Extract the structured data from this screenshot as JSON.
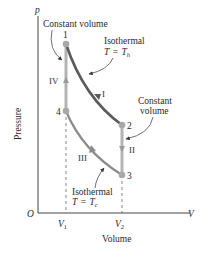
{
  "diagram": {
    "type": "pV diagram - Stirling cycle",
    "axes": {
      "y_axis_symbol": "p",
      "y_axis_label": "Pressure",
      "x_axis_symbol": "V",
      "x_axis_label": "Volume",
      "origin_label": "O",
      "x_ticks": [
        {
          "main": "V",
          "sub": "1"
        },
        {
          "main": "V",
          "sub": "2"
        }
      ]
    },
    "points": [
      {
        "label": "1"
      },
      {
        "label": "2"
      },
      {
        "label": "3"
      },
      {
        "label": "4"
      }
    ],
    "processes": [
      {
        "label": "I",
        "from": "1",
        "to": "2",
        "kind": "isothermal"
      },
      {
        "label": "II",
        "from": "2",
        "to": "3",
        "kind": "constant volume"
      },
      {
        "label": "III",
        "from": "3",
        "to": "4",
        "kind": "isothermal"
      },
      {
        "label": "IV",
        "from": "4",
        "to": "1",
        "kind": "constant volume"
      }
    ],
    "annotations": {
      "const_vol_left": "Constant volume",
      "isothermal_hot_title": "Isothermal",
      "isothermal_hot_eq_T": "T",
      "isothermal_hot_eq_eq": "=",
      "isothermal_hot_eq_Th": "T",
      "isothermal_hot_eq_sub": "h",
      "const_vol_right_1": "Constant",
      "const_vol_right_2": "volume",
      "isothermal_cold_title": "Isothermal",
      "isothermal_cold_eq_T": "T",
      "isothermal_cold_eq_eq": "=",
      "isothermal_cold_eq_Tc": "T",
      "isothermal_cold_eq_sub": "c"
    },
    "colors": {
      "hot_isotherm": "#5a5a5a",
      "cold_isotherm": "#8a8a8a",
      "constant_volume": "#b3b3b3",
      "points": "#a8a8a8",
      "axes": "#444444",
      "text": "#2a2a2a"
    }
  }
}
